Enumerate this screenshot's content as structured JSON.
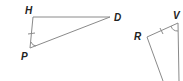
{
  "diagram": {
    "type": "geometry",
    "triangle_left": {
      "vertices": [
        {
          "label": "H",
          "x": 33,
          "y": 17
        },
        {
          "label": "D",
          "x": 110,
          "y": 17
        },
        {
          "label": "P",
          "x": 30,
          "y": 48
        }
      ],
      "tick_mark_side": "HP",
      "angle_mark_vertex": "P"
    },
    "triangle_right": {
      "vertices": [
        {
          "label": "R",
          "x": 147,
          "y": 37
        },
        {
          "label": "V",
          "x": 178,
          "y": 23
        }
      ],
      "tick_mark_side": "RV",
      "angle_mark_vertex": "V"
    },
    "colors": {
      "line": "#8a8a8a",
      "label": "#222222"
    }
  }
}
